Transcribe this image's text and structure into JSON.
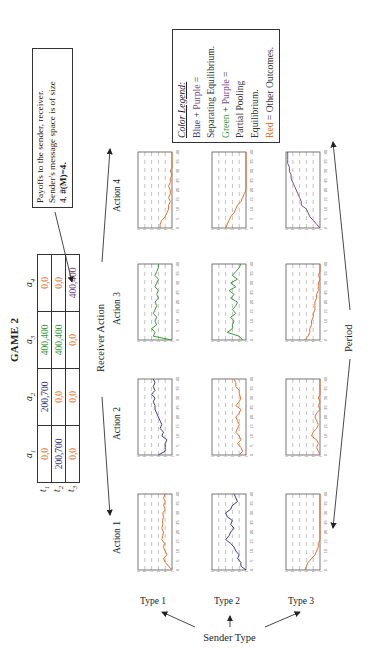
{
  "figure": {
    "orientation": "rotated 90 degrees counter-clockwise",
    "title": "GAME 2",
    "note": {
      "line1": "Payoffs to the sender, receiver.",
      "line2": "Sender's message space is of size",
      "line3_prefix": "4, ",
      "line3_bold": "#(M)=4."
    },
    "legend": {
      "title": "Color Legend:",
      "items": [
        {
          "parts": [
            {
              "text": "Blue",
              "color": "#3b3b86"
            },
            {
              "text": " + ",
              "color": "#333333"
            },
            {
              "text": "Purple",
              "color": "#7a4a8c"
            },
            {
              "text": " =",
              "color": "#333333"
            }
          ]
        },
        {
          "parts": [
            {
              "text": "Separating Equilibrium.",
              "color": "#333333"
            }
          ]
        },
        {
          "parts": [
            {
              "text": "Green",
              "color": "#3a9a3a"
            },
            {
              "text": " + ",
              "color": "#333333"
            },
            {
              "text": "Purple",
              "color": "#7a4a8c"
            },
            {
              "text": " =",
              "color": "#333333"
            }
          ]
        },
        {
          "parts": [
            {
              "text": "Partial Pooling",
              "color": "#333333"
            }
          ]
        },
        {
          "parts": [
            {
              "text": "Equilibrium.",
              "color": "#333333"
            }
          ]
        },
        {
          "parts": [
            {
              "text": "Red",
              "color": "#e8702a"
            },
            {
              "text": " = Other Outcomes.",
              "color": "#333333"
            }
          ]
        }
      ]
    },
    "payoff_table": {
      "columns": [
        "a1",
        "a2",
        "a3",
        "a4"
      ],
      "column_labels": [
        {
          "base": "a",
          "sub": "1"
        },
        {
          "base": "a",
          "sub": "2"
        },
        {
          "base": "a",
          "sub": "3"
        },
        {
          "base": "a",
          "sub": "4"
        }
      ],
      "rows": [
        {
          "label_base": "t",
          "label_sub": "1",
          "cells": [
            {
              "text": "0,0",
              "color": "#e8702a"
            },
            {
              "text": "200,700",
              "color": "#3b3b86"
            },
            {
              "text": "400,400",
              "color": "#3a9a3a"
            },
            {
              "text": "0,0",
              "color": "#e8702a"
            }
          ]
        },
        {
          "label_base": "t",
          "label_sub": "2",
          "cells": [
            {
              "text": "200,700",
              "color": "#3b3b86"
            },
            {
              "text": "0,0",
              "color": "#e8702a"
            },
            {
              "text": "400,400",
              "color": "#3a9a3a"
            },
            {
              "text": "0,0",
              "color": "#e8702a"
            }
          ]
        },
        {
          "label_base": "t",
          "label_sub": "3",
          "cells": [
            {
              "text": "0,0",
              "color": "#e8702a"
            },
            {
              "text": "0,0",
              "color": "#e8702a"
            },
            {
              "text": "0,0",
              "color": "#e8702a"
            },
            {
              "text": "400,400",
              "color": "#7a4a8c"
            }
          ]
        }
      ]
    },
    "axes_labels": {
      "receiver_action": "Receiver Action",
      "actions": [
        "Action 1",
        "Action 2",
        "Action 3",
        "Action 4"
      ],
      "sender_type": "Sender Type",
      "types": [
        "Type 1",
        "Type 2",
        "Type 3"
      ],
      "period": "Period"
    }
  },
  "colors": {
    "blue": "#3b3b86",
    "purple": "#7a4a8c",
    "green": "#3a9a3a",
    "red": "#e8702a",
    "frame": "#555555",
    "grid": "#9a9a9a"
  },
  "chart_data": {
    "type": "line",
    "xlabel": "Period",
    "ylabel": "Frequency",
    "xlim": [
      0,
      40
    ],
    "ylim": [
      0.0,
      1.0
    ],
    "x_ticks": [
      0,
      5,
      10,
      15,
      20,
      25,
      30,
      35,
      40
    ],
    "y_ticks": [
      "0.0",
      "0.2",
      "0.4",
      "0.6",
      "0.8",
      "1.0"
    ],
    "grid": "dashed vertical at y ticks",
    "x": [
      0,
      2,
      4,
      6,
      8,
      10,
      12,
      14,
      16,
      18,
      20,
      22,
      24,
      26,
      28,
      30,
      32,
      34,
      36,
      38,
      40
    ],
    "panels": [
      {
        "sender_type": "Type 1",
        "receiver_action": "Action 1",
        "color": "red",
        "values": [
          0.0,
          0.1,
          0.2,
          0.25,
          0.15,
          0.2,
          0.25,
          0.22,
          0.3,
          0.27,
          0.25,
          0.3,
          0.27,
          0.28,
          0.25,
          0.27,
          0.2,
          0.25,
          0.2,
          0.25,
          0.2
        ]
      },
      {
        "sender_type": "Type 1",
        "receiver_action": "Action 2",
        "color": "blue",
        "values": [
          0.4,
          0.2,
          0.2,
          0.2,
          0.15,
          0.3,
          0.25,
          0.35,
          0.3,
          0.35,
          0.4,
          0.45,
          0.5,
          0.5,
          0.55,
          0.5,
          0.6,
          0.5,
          0.55,
          0.5,
          0.55
        ]
      },
      {
        "sender_type": "Type 1",
        "receiver_action": "Action 3",
        "color": "green",
        "values": [
          0.0,
          0.55,
          0.5,
          0.6,
          0.45,
          0.5,
          0.45,
          0.55,
          0.5,
          0.45,
          0.5,
          0.4,
          0.45,
          0.4,
          0.5,
          0.45,
          0.4,
          0.5,
          0.45,
          0.4,
          0.4
        ]
      },
      {
        "sender_type": "Type 1",
        "receiver_action": "Action 4",
        "color": "red",
        "values": [
          0.35,
          0.35,
          0.3,
          0.2,
          0.15,
          0.1,
          0.1,
          0.05,
          0.1,
          0.05,
          0.05,
          0.1,
          0.05,
          0.05,
          0.0,
          0.05,
          0.0,
          0.0,
          0.0,
          0.0,
          0.0
        ]
      },
      {
        "sender_type": "Type 2",
        "receiver_action": "Action 1",
        "color": "blue",
        "values": [
          0.0,
          0.15,
          0.15,
          0.25,
          0.2,
          0.3,
          0.35,
          0.45,
          0.6,
          0.5,
          0.45,
          0.35,
          0.45,
          0.4,
          0.55,
          0.6,
          0.45,
          0.4,
          0.25,
          0.3,
          0.35
        ]
      },
      {
        "sender_type": "Type 2",
        "receiver_action": "Action 2",
        "color": "red",
        "values": [
          0.2,
          0.1,
          0.15,
          0.25,
          0.15,
          0.2,
          0.3,
          0.25,
          0.2,
          0.25,
          0.3,
          0.2,
          0.15,
          0.3,
          0.2,
          0.15,
          0.2,
          0.2,
          0.3,
          0.3,
          0.35
        ]
      },
      {
        "sender_type": "Type 2",
        "receiver_action": "Action 3",
        "color": "green",
        "values": [
          0.1,
          0.2,
          0.55,
          0.4,
          0.4,
          0.35,
          0.45,
          0.3,
          0.4,
          0.3,
          0.25,
          0.45,
          0.35,
          0.5,
          0.3,
          0.45,
          0.25,
          0.4,
          0.3,
          0.2,
          0.15
        ]
      },
      {
        "sender_type": "Type 2",
        "receiver_action": "Action 4",
        "color": "red",
        "values": [
          0.6,
          0.55,
          0.5,
          0.45,
          0.35,
          0.3,
          0.25,
          0.15,
          0.1,
          0.05,
          0.0,
          0.0,
          0.0,
          0.0,
          0.0,
          0.0,
          0.0,
          0.0,
          0.0,
          0.0,
          0.0
        ]
      },
      {
        "sender_type": "Type 3",
        "receiver_action": "Action 1",
        "color": "red",
        "values": [
          0.45,
          0.4,
          0.35,
          0.25,
          0.15,
          0.1,
          0.05,
          0.05,
          0.0,
          0.0,
          0.0,
          0.0,
          0.0,
          0.0,
          0.0,
          0.0,
          0.0,
          0.0,
          0.0,
          0.0,
          0.0
        ]
      },
      {
        "sender_type": "Type 3",
        "receiver_action": "Action 2",
        "color": "red",
        "values": [
          0.0,
          0.05,
          0.1,
          0.05,
          0.1,
          0.25,
          0.2,
          0.1,
          0.05,
          0.1,
          0.15,
          0.1,
          0.0,
          0.05,
          0.0,
          0.05,
          0.0,
          0.0,
          0.0,
          0.0,
          0.0
        ]
      },
      {
        "sender_type": "Type 3",
        "receiver_action": "Action 3",
        "color": "red",
        "values": [
          0.45,
          0.35,
          0.3,
          0.3,
          0.25,
          0.25,
          0.2,
          0.2,
          0.15,
          0.15,
          0.15,
          0.1,
          0.1,
          0.05,
          0.05,
          0.05,
          0.0,
          0.05,
          0.0,
          0.0,
          0.0
        ]
      },
      {
        "sender_type": "Type 3",
        "receiver_action": "Action 4",
        "color": "purple",
        "values": [
          0.0,
          0.1,
          0.2,
          0.3,
          0.35,
          0.4,
          0.55,
          0.55,
          0.6,
          0.65,
          0.7,
          0.75,
          0.8,
          0.85,
          0.85,
          0.9,
          0.9,
          0.95,
          0.95,
          0.95,
          0.95
        ]
      }
    ]
  }
}
